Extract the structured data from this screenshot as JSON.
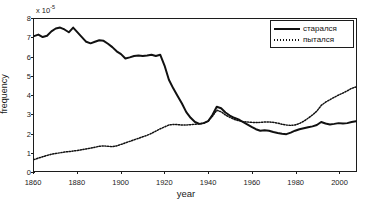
{
  "chart_data": {
    "type": "line",
    "title": "",
    "xlabel": "year",
    "ylabel": "frequency",
    "y_exponent_label": "x 10",
    "y_exponent_power": "-5",
    "xlim": [
      1860,
      2008
    ],
    "ylim": [
      0,
      8
    ],
    "xticks": [
      1860,
      1880,
      1900,
      1920,
      1940,
      1960,
      1980,
      2000
    ],
    "yticks": [
      0,
      1,
      2,
      3,
      4,
      5,
      6,
      7,
      8
    ],
    "grid": false,
    "legend_position": "top-right",
    "x": [
      1860,
      1862,
      1864,
      1866,
      1868,
      1870,
      1872,
      1874,
      1876,
      1878,
      1880,
      1882,
      1884,
      1886,
      1888,
      1890,
      1892,
      1894,
      1896,
      1898,
      1900,
      1902,
      1904,
      1906,
      1908,
      1910,
      1912,
      1914,
      1916,
      1918,
      1920,
      1922,
      1924,
      1926,
      1928,
      1930,
      1932,
      1934,
      1936,
      1938,
      1940,
      1942,
      1944,
      1946,
      1948,
      1950,
      1952,
      1954,
      1956,
      1958,
      1960,
      1962,
      1964,
      1966,
      1968,
      1970,
      1972,
      1974,
      1976,
      1978,
      1980,
      1982,
      1984,
      1986,
      1988,
      1990,
      1992,
      1994,
      1996,
      1998,
      2000,
      2002,
      2004,
      2006,
      2008
    ],
    "series": [
      {
        "name": "старался",
        "style": "solid",
        "color": "#111111",
        "values": [
          7.1,
          7.18,
          7.05,
          7.12,
          7.35,
          7.5,
          7.55,
          7.45,
          7.3,
          7.55,
          7.3,
          7.05,
          6.8,
          6.72,
          6.8,
          6.88,
          6.85,
          6.7,
          6.52,
          6.3,
          6.15,
          5.92,
          5.98,
          6.05,
          6.08,
          6.05,
          6.08,
          6.12,
          6.05,
          6.12,
          5.55,
          4.8,
          4.35,
          3.95,
          3.55,
          3.1,
          2.8,
          2.58,
          2.48,
          2.52,
          2.62,
          2.95,
          3.38,
          3.3,
          3.08,
          2.92,
          2.8,
          2.72,
          2.58,
          2.45,
          2.32,
          2.2,
          2.12,
          2.15,
          2.12,
          2.05,
          2.0,
          1.96,
          1.94,
          2.02,
          2.12,
          2.2,
          2.25,
          2.3,
          2.35,
          2.42,
          2.58,
          2.5,
          2.45,
          2.48,
          2.52,
          2.5,
          2.52,
          2.58,
          2.62
        ]
      },
      {
        "name": "пытался",
        "style": "dotted",
        "color": "#111111",
        "values": [
          0.6,
          0.68,
          0.75,
          0.82,
          0.88,
          0.92,
          0.96,
          1.0,
          1.02,
          1.05,
          1.08,
          1.12,
          1.16,
          1.2,
          1.25,
          1.3,
          1.32,
          1.3,
          1.28,
          1.32,
          1.4,
          1.48,
          1.56,
          1.64,
          1.72,
          1.8,
          1.88,
          1.98,
          2.1,
          2.22,
          2.32,
          2.42,
          2.45,
          2.44,
          2.42,
          2.42,
          2.44,
          2.46,
          2.48,
          2.52,
          2.62,
          2.88,
          3.2,
          3.12,
          2.95,
          2.82,
          2.72,
          2.65,
          2.6,
          2.58,
          2.56,
          2.55,
          2.56,
          2.58,
          2.58,
          2.56,
          2.52,
          2.46,
          2.42,
          2.4,
          2.42,
          2.5,
          2.62,
          2.78,
          2.95,
          3.15,
          3.45,
          3.62,
          3.75,
          3.88,
          4.0,
          4.1,
          4.22,
          4.35,
          4.42
        ]
      }
    ]
  },
  "legend": {
    "entries": [
      {
        "label": "старался",
        "style": "solid"
      },
      {
        "label": "пытался",
        "style": "dotted"
      }
    ]
  }
}
